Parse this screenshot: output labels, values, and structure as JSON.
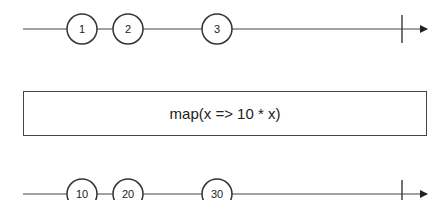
{
  "diagram": {
    "type": "marble",
    "colors": {
      "stroke": "#444444",
      "text": "#222222",
      "background": "#ffffff"
    },
    "input_stream": {
      "marbles": [
        {
          "label": "1",
          "x": 82
        },
        {
          "label": "2",
          "x": 128
        },
        {
          "label": "3",
          "x": 217
        }
      ],
      "completed": true
    },
    "operator": {
      "label": "map(x => 10 * x)"
    },
    "output_stream": {
      "marbles": [
        {
          "label": "10",
          "x": 82
        },
        {
          "label": "20",
          "x": 128
        },
        {
          "label": "30",
          "x": 217
        }
      ],
      "completed": true
    }
  }
}
